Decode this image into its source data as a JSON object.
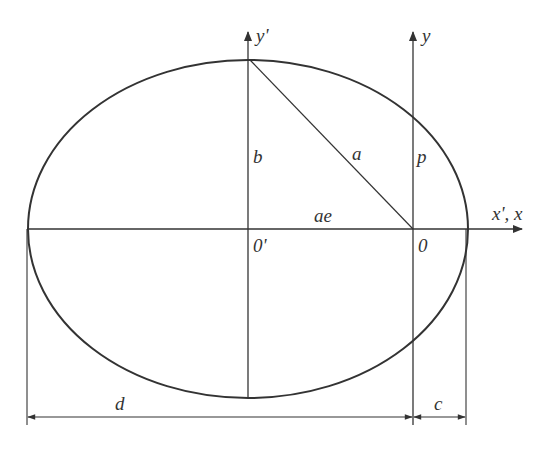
{
  "diagram": {
    "type": "ellipse-geometry",
    "colors": {
      "stroke": "#333333",
      "background": "#ffffff"
    },
    "labels": {
      "y_prime_axis": "y'",
      "y_axis": "y",
      "x_axis": "x', x",
      "semi_minor": "b",
      "semi_major": "a",
      "semi_latus_rectum": "p",
      "focal_offset": "ae",
      "center": "0'",
      "focus": "0",
      "dim_d": "d",
      "dim_c": "c"
    }
  }
}
